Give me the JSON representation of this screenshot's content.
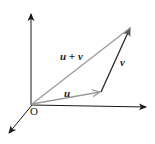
{
  "diagram": {
    "type": "vector-addition",
    "labels": {
      "origin": "O",
      "u": "u",
      "v": "v",
      "sum": "u + v"
    },
    "colors": {
      "axes": "#1a1a1a",
      "u": "#9a9a9a",
      "v": "#2a2a2a",
      "sum": "#9a9a9a"
    }
  }
}
